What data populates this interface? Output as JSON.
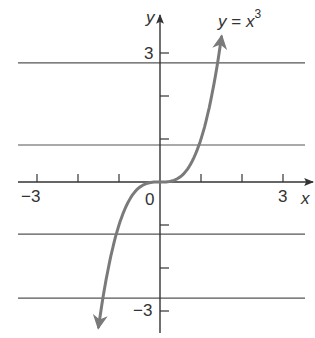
{
  "chart_data": {
    "type": "line",
    "title_parts": {
      "lhs": "y",
      "eq": " = ",
      "base": "x",
      "exp": "3"
    },
    "xlabel": "x",
    "ylabel": "y",
    "xlim": [
      -3.5,
      3.5
    ],
    "ylim": [
      -3.5,
      3.5
    ],
    "x_ticks": [
      -3,
      -2,
      -1,
      0,
      1,
      2,
      3
    ],
    "y_ticks": [
      -3,
      -2,
      -1,
      1,
      2,
      3
    ],
    "x_tick_labels": {
      "-3": "−3",
      "0": "0",
      "3": "3"
    },
    "y_tick_labels": {
      "3": "3",
      "-3": "−3"
    },
    "grid": false,
    "series": [
      {
        "name": "y = x^3",
        "color": "#7a7a7a",
        "x": [
          -1.9,
          -1.5,
          -1.2,
          -1.0,
          -0.75,
          -0.5,
          -0.25,
          0,
          0.25,
          0.5,
          0.75,
          1.0,
          1.2,
          1.5
        ],
        "y": [
          -6.86,
          -3.375,
          -1.728,
          -1.0,
          -0.422,
          -0.125,
          -0.016,
          0,
          0.016,
          0.125,
          0.422,
          1.0,
          1.728,
          3.375
        ],
        "arrows": "both"
      }
    ],
    "horizontal_rules_y": [
      2.77,
      0.86,
      -1.21,
      -2.7
    ]
  },
  "labels": {
    "y_axis": "y",
    "x_axis": "x",
    "x_neg3": "−3",
    "x_zero": "0",
    "x_pos3": "3",
    "y_pos3": "3",
    "y_neg3": "−3"
  },
  "colors": {
    "axis": "#333333",
    "curve": "#7a7a7a",
    "rule": "#555555"
  }
}
